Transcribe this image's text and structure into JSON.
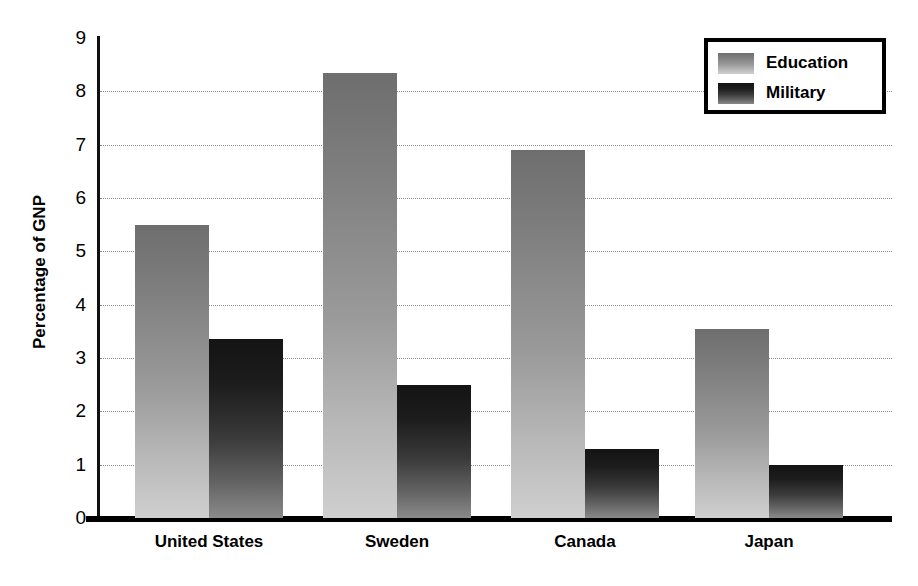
{
  "chart_data": {
    "type": "bar",
    "title": "",
    "xlabel": "",
    "ylabel": "Percentage of GNP",
    "ylim": [
      0,
      9
    ],
    "yticks": [
      "0",
      "1",
      "2",
      "3",
      "4",
      "5",
      "6",
      "7",
      "8",
      "9"
    ],
    "grid": true,
    "legend_position": "top-right",
    "categories": [
      "United States",
      "Sweden",
      "Canada",
      "Japan"
    ],
    "series": [
      {
        "name": "Education",
        "values": [
          5.5,
          8.35,
          6.9,
          3.55
        ],
        "color": "#9a9a9a"
      },
      {
        "name": "Military",
        "values": [
          3.35,
          2.5,
          1.3,
          1.0
        ],
        "color": "#333333"
      }
    ]
  },
  "legend": {
    "entries": [
      {
        "label": "Education",
        "swatch": "education-swatch"
      },
      {
        "label": "Military",
        "swatch": "military-swatch"
      }
    ]
  },
  "axis": {
    "y_title": "Percentage of GNP"
  }
}
